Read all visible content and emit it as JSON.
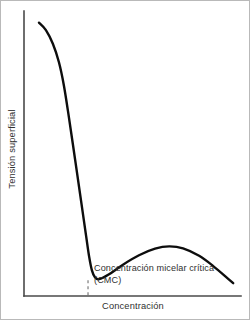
{
  "chart_data": {
    "type": "line",
    "title": "",
    "xlabel": "Concentración",
    "ylabel": "Tensión superficial",
    "grid": false,
    "legend": null,
    "axis_ticks": {
      "x": [],
      "y": []
    },
    "xlim": [
      0,
      1
    ],
    "ylim": [
      0,
      1
    ],
    "series": [
      {
        "name": "Tensión superficial",
        "color": "#0d0d0d",
        "points": [
          {
            "x": 0.069,
            "y": 0.959
          },
          {
            "x": 0.101,
            "y": 0.933
          },
          {
            "x": 0.133,
            "y": 0.885
          },
          {
            "x": 0.161,
            "y": 0.82
          },
          {
            "x": 0.184,
            "y": 0.738
          },
          {
            "x": 0.207,
            "y": 0.627
          },
          {
            "x": 0.235,
            "y": 0.481
          },
          {
            "x": 0.263,
            "y": 0.334
          },
          {
            "x": 0.286,
            "y": 0.212
          },
          {
            "x": 0.3,
            "y": 0.139
          },
          {
            "x": 0.313,
            "y": 0.09
          },
          {
            "x": 0.327,
            "y": 0.066
          },
          {
            "x": 0.346,
            "y": 0.059
          },
          {
            "x": 0.392,
            "y": 0.076
          },
          {
            "x": 0.456,
            "y": 0.11
          },
          {
            "x": 0.53,
            "y": 0.143
          },
          {
            "x": 0.604,
            "y": 0.166
          },
          {
            "x": 0.669,
            "y": 0.174
          },
          {
            "x": 0.733,
            "y": 0.167
          },
          {
            "x": 0.807,
            "y": 0.141
          },
          {
            "x": 0.872,
            "y": 0.105
          },
          {
            "x": 0.937,
            "y": 0.063
          },
          {
            "x": 0.964,
            "y": 0.045
          }
        ]
      }
    ],
    "annotations": [
      {
        "name": "cmc-marker",
        "type": "vertical-dashed-line",
        "x": 0.295,
        "y_from": 0.055,
        "y_to": 0.0,
        "label_line_1": "Concentración micelar crítica",
        "label_line_2": "(CMC)"
      }
    ]
  },
  "chart": {
    "ylabel": "Tensión superficial",
    "xlabel": "Concentración",
    "cmc": {
      "line_1": "Concentración micelar crítica",
      "line_2": "(CMC)"
    }
  },
  "colors": {
    "curve": "#0d0d0d",
    "axis": "#4a4a4a",
    "dashed": "#6f6f6f",
    "text": "#303030",
    "background": "#ffffff",
    "frame": "#b9b9b9"
  }
}
